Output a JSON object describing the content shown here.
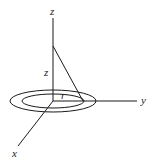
{
  "figure": {
    "type": "3d-coordinate-diagram",
    "axes": {
      "z_label": "z",
      "y_label": "y",
      "x_label": "x"
    },
    "labels": {
      "height": "z",
      "radius": "r"
    },
    "colors": {
      "stroke": "#1a1a1a",
      "background": "#ffffff"
    }
  }
}
